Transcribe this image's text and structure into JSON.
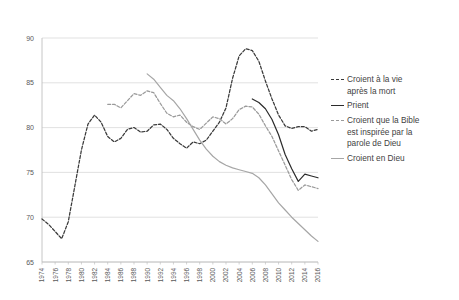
{
  "chart_data": {
    "type": "line",
    "title": "",
    "subtitle": "",
    "xlabel": "",
    "ylabel": "",
    "xlim": [
      1974,
      2016
    ],
    "ylim": [
      65,
      90
    ],
    "yticks": [
      65,
      70,
      75,
      80,
      85,
      90
    ],
    "ytick_labels": [
      "65",
      "70",
      "75",
      "80",
      "85",
      "90"
    ],
    "x": [
      1974,
      1976,
      1978,
      1980,
      1982,
      1984,
      1986,
      1988,
      1990,
      1992,
      1994,
      1996,
      1998,
      2000,
      2002,
      2004,
      2006,
      2008,
      2010,
      2012,
      2014,
      2016
    ],
    "xtick_labels": [
      "1974",
      "1976",
      "1978",
      "1980",
      "1982",
      "1984",
      "1986",
      "1988",
      "1990",
      "1992",
      "1994",
      "1996",
      "1998",
      "2000",
      "2002",
      "2004",
      "2006",
      "2008",
      "2010",
      "2012",
      "2014",
      "2016"
    ],
    "grid": "horizontal",
    "legend_position": "right",
    "series": [
      {
        "name": "Croient à la vie après la mort",
        "style": "dashed",
        "color": "#3a3a3a",
        "x": [
          1974,
          1975,
          1976,
          1977,
          1978,
          1979,
          1980,
          1981,
          1982,
          1983,
          1984,
          1985,
          1986,
          1987,
          1988,
          1989,
          1990,
          1991,
          1992,
          1993,
          1994,
          1995,
          1996,
          1997,
          1998,
          1999,
          2000,
          2001,
          2002,
          2003,
          2004,
          2005,
          2006,
          2007,
          2008,
          2009,
          2010,
          2011,
          2012,
          2013,
          2014,
          2015,
          2016
        ],
        "values": [
          69.8,
          69.2,
          68.4,
          67.6,
          69.5,
          73.5,
          77.5,
          80.4,
          81.4,
          80.6,
          79.0,
          78.4,
          78.8,
          79.8,
          80.0,
          79.5,
          79.6,
          80.3,
          80.4,
          79.8,
          78.8,
          78.2,
          77.7,
          78.4,
          78.2,
          78.6,
          79.6,
          80.6,
          82.2,
          85.5,
          88.0,
          88.8,
          88.6,
          87.4,
          85.2,
          83.2,
          81.4,
          80.2,
          79.9,
          80.1,
          80.1,
          79.6,
          79.8
        ]
      },
      {
        "name": "Prient",
        "style": "solid",
        "color": "#2b2b2b",
        "x": [
          2006,
          2007,
          2008,
          2009,
          2010,
          2011,
          2012,
          2013,
          2014,
          2015,
          2016
        ],
        "values": [
          83.2,
          82.8,
          82.1,
          80.9,
          79.2,
          77.0,
          75.4,
          74.0,
          74.8,
          74.6,
          74.4
        ]
      },
      {
        "name": "Croient que la Bible est inspirée par la parole de Dieu",
        "style": "dashed",
        "color": "#9a9a9a",
        "x": [
          1984,
          1985,
          1986,
          1987,
          1988,
          1989,
          1990,
          1991,
          1992,
          1993,
          1994,
          1995,
          1996,
          1997,
          1998,
          1999,
          2000,
          2001,
          2002,
          2003,
          2004,
          2005,
          2006,
          2007,
          2008,
          2009,
          2010,
          2011,
          2012,
          2013,
          2014,
          2015,
          2016
        ],
        "values": [
          82.6,
          82.6,
          82.2,
          83.0,
          83.8,
          83.6,
          84.1,
          83.9,
          82.7,
          81.6,
          81.2,
          81.4,
          80.6,
          80.1,
          79.8,
          80.5,
          81.2,
          81.0,
          80.4,
          81.0,
          82.0,
          82.4,
          82.3,
          81.5,
          80.2,
          79.0,
          77.4,
          75.8,
          74.2,
          73.0,
          73.6,
          73.4,
          73.2
        ]
      },
      {
        "name": "Croient en Dieu",
        "style": "solid",
        "color": "#a6a6a6",
        "x": [
          1990,
          1991,
          1992,
          1993,
          1994,
          1995,
          1996,
          1997,
          1998,
          1999,
          2000,
          2001,
          2002,
          2003,
          2004,
          2005,
          2006,
          2007,
          2008,
          2009,
          2010,
          2011,
          2012,
          2013,
          2014,
          2015,
          2016
        ],
        "values": [
          86.0,
          85.4,
          84.5,
          83.6,
          83.0,
          82.1,
          81.0,
          79.8,
          78.6,
          77.6,
          76.8,
          76.2,
          75.8,
          75.5,
          75.3,
          75.1,
          74.9,
          74.4,
          73.6,
          72.6,
          71.6,
          70.8,
          70.0,
          69.3,
          68.6,
          67.9,
          67.3
        ]
      }
    ],
    "legend": [
      {
        "label": "Croient à la vie\naprès la mort",
        "style": "dashed",
        "color": "#3a3a3a"
      },
      {
        "label": "Prient",
        "style": "solid",
        "color": "#2b2b2b"
      },
      {
        "label": "Croient que la Bible\nest inspirée par la\nparole de Dieu",
        "style": "dashed",
        "color": "#9a9a9a"
      },
      {
        "label": "Croient en Dieu",
        "style": "solid",
        "color": "#a6a6a6"
      }
    ],
    "colors": {
      "grid": "#d9d9d9",
      "axis": "#bfbfbf",
      "background": "#ffffff",
      "tick_label": "#5a5a5a"
    }
  }
}
